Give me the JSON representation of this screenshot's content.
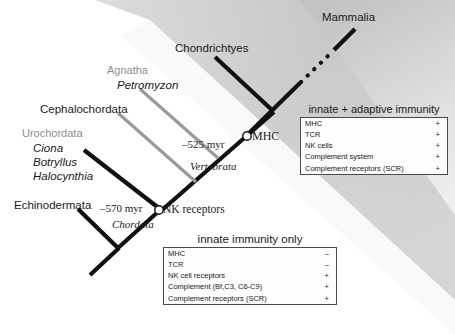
{
  "diagram": {
    "taxa": {
      "mammalia": "Mammalia",
      "chondrichtyes": "Chondrichtyes",
      "agnatha": "Agnatha",
      "petromyzon": "Petromyzon",
      "cephalochordata": "Cephalochordata",
      "urochordata": "Urochordata",
      "ciona": "Ciona",
      "botryllus": "Botryllus",
      "halocynthia": "Halocynthia",
      "echinodermata": "Echinodermata"
    },
    "nodes": {
      "divergence_vertebrata": "–525 myr",
      "clade_vertebrata": "Vertebrata",
      "marker_mhc": "MHC",
      "divergence_chordata": "–570 myr",
      "clade_chordata": "Chordata",
      "marker_nk_receptors": "NK receptors"
    },
    "colors": {
      "branch_black": "#111111",
      "branch_gray": "#9a9a9a",
      "label_gray": "#8e8e8e",
      "band_gray": "#b9b9b9",
      "table_border": "#4a4a4a"
    }
  },
  "panels": {
    "adaptive": {
      "title": "innate + adaptive immunity",
      "rows": [
        {
          "feature": "MHC",
          "status": "+"
        },
        {
          "feature": "TCR",
          "status": "+"
        },
        {
          "feature": "NK cells",
          "status": "+"
        },
        {
          "feature": "Complement system",
          "status": "+"
        },
        {
          "feature": "Complement receptors (SCR)",
          "status": "+"
        }
      ]
    },
    "innate": {
      "title": "innate immunity only",
      "rows": [
        {
          "feature": "MHC",
          "status": "–"
        },
        {
          "feature": "TCR",
          "status": "–"
        },
        {
          "feature": "NK cell receptors",
          "status": "+"
        },
        {
          "feature": "Complement (Bf,C3, C6-C9)",
          "status": "+"
        },
        {
          "feature": "Complement receptors (SCR)",
          "status": "+"
        }
      ]
    }
  }
}
